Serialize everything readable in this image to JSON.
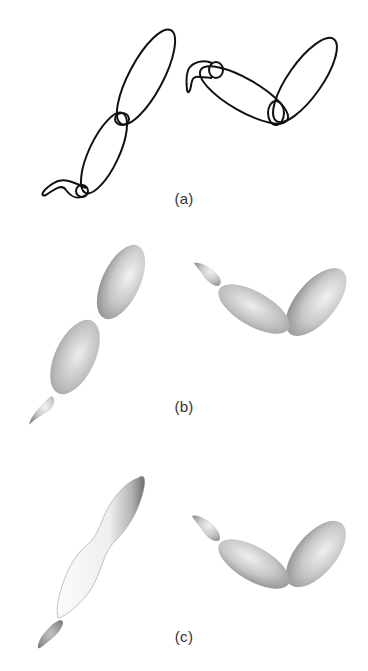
{
  "figure": {
    "panels": [
      {
        "id": "a",
        "label": "(a)",
        "style": "outline",
        "description": "wireframe ellipse outlines of two articulated limbs"
      },
      {
        "id": "b",
        "label": "(b)",
        "style": "shaded-ellipsoids",
        "description": "shaded ellipsoid segments of two articulated limbs"
      },
      {
        "id": "c",
        "label": "(c)",
        "style": "blended-surface",
        "description": "smooth blended surface (left) and shaded ellipsoids (right)"
      }
    ],
    "colors": {
      "background": "#ffffff",
      "outline": "#111111",
      "shade_light": "#f2f2f2",
      "shade_mid": "#c4c4c4",
      "shade_dark": "#8c8c8c",
      "caption": "#333333"
    }
  }
}
